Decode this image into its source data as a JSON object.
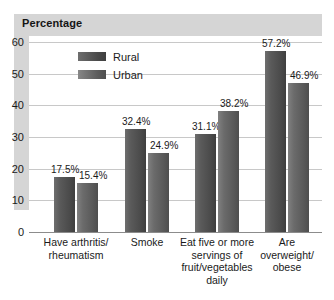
{
  "header": {
    "title": "Percentage"
  },
  "legend": {
    "position": "top-left-inside",
    "items": [
      {
        "label": "Rural",
        "color": "#4a4a4a"
      },
      {
        "label": "Urban",
        "color": "#5c5c5c"
      }
    ]
  },
  "axis": {
    "y_ticks": [
      "60",
      "50",
      "40",
      "30",
      "20",
      "10",
      "0"
    ],
    "y_values": [
      60,
      50,
      40,
      30,
      20,
      10,
      0
    ]
  },
  "bars": [
    {
      "group": 0,
      "series": "Rural",
      "value": 17.5,
      "label": "17.5%"
    },
    {
      "group": 0,
      "series": "Urban",
      "value": 15.4,
      "label": "15.4%"
    },
    {
      "group": 1,
      "series": "Rural",
      "value": 32.4,
      "label": "32.4%"
    },
    {
      "group": 1,
      "series": "Urban",
      "value": 24.9,
      "label": "24.9%"
    },
    {
      "group": 2,
      "series": "Rural",
      "value": 31.1,
      "label": "31.1%"
    },
    {
      "group": 2,
      "series": "Urban",
      "value": 38.2,
      "label": "38.2%"
    },
    {
      "group": 3,
      "series": "Rural",
      "value": 57.2,
      "label": "57.2%"
    },
    {
      "group": 3,
      "series": "Urban",
      "value": 46.9,
      "label": "46.9%"
    }
  ],
  "x_labels": [
    "Have arthritis/\nrheumatism",
    "Smoke",
    "Eat five or more\nservings of\nfruit/vegetables\ndaily",
    "Are\noverweight/\nobese"
  ],
  "chart_data": {
    "type": "bar",
    "title": "Percentage",
    "xlabel": "",
    "ylabel": "Percentage",
    "ylim": [
      0,
      60
    ],
    "yticks": [
      0,
      10,
      20,
      30,
      40,
      50,
      60
    ],
    "grid": true,
    "legend_position": "upper left (inside plot)",
    "categories": [
      "Have arthritis/ rheumatism",
      "Smoke",
      "Eat five or more servings of fruit/vegetables daily",
      "Are overweight/ obese"
    ],
    "series": [
      {
        "name": "Rural",
        "color": "#4a4a4a",
        "values": [
          17.5,
          32.4,
          31.1,
          57.2
        ],
        "data_labels": [
          "17.5%",
          "32.4%",
          "31.1%",
          "57.2%"
        ]
      },
      {
        "name": "Urban",
        "color": "#5c5c5c",
        "values": [
          15.4,
          24.9,
          38.2,
          46.9
        ],
        "data_labels": [
          "15.4%",
          "24.9%",
          "38.2%",
          "46.9%"
        ]
      }
    ]
  }
}
